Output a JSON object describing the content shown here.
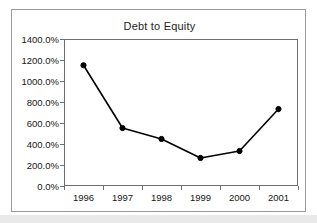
{
  "chart_data": {
    "type": "line",
    "title": "Debt to Equity",
    "xlabel": "",
    "ylabel": "",
    "categories": [
      "1996",
      "1997",
      "1998",
      "1999",
      "2000",
      "2001"
    ],
    "values": [
      1150,
      552,
      448,
      267,
      333,
      733
    ],
    "value_suffix": "%",
    "ylim": [
      0,
      1400
    ],
    "yticks": [
      0,
      200,
      400,
      600,
      800,
      1000,
      1200,
      1400
    ],
    "ytick_labels": [
      "0.0%",
      "200.0%",
      "400.0%",
      "600.0%",
      "800.0%",
      "1000.0%",
      "1200.0%",
      "1400.0%"
    ],
    "grid": false,
    "legend": false,
    "series": [
      {
        "name": "Debt to Equity",
        "values": [
          1150,
          552,
          448,
          267,
          333,
          733
        ],
        "color": "#000000",
        "marker": "filled-circle",
        "line_width": 1.6
      }
    ],
    "colors": {
      "line": "#000000",
      "marker": "#000000",
      "axis": "#6f6f6f",
      "frame": "#9a9a9a",
      "text": "#161616",
      "background": "#ffffff"
    }
  }
}
